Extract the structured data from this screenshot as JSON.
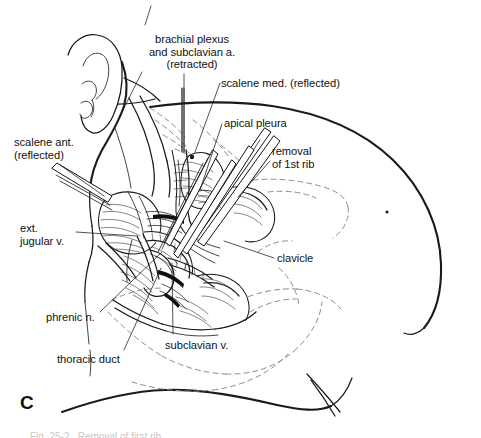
{
  "figure": {
    "letter": "C",
    "domain": "anatomical-surgical-illustration",
    "background_color": "#ffffff",
    "ink_color": "#1a1a1a",
    "hidden_structure_color": "#8d8d8d",
    "caption_partial": "Fig. 25-2.  Removal of first rib  ..."
  },
  "labels": [
    {
      "id": "brachial-plexus",
      "lines": [
        "brachial plexus",
        "and subclavian a.",
        "(retracted)"
      ],
      "text": "brachial plexus\nand subclavian a.\n(retracted)",
      "x": 134,
      "y": 33,
      "align": "center",
      "width": 116
    },
    {
      "id": "scalene-med",
      "lines": [
        "scalene med. (reflected)"
      ],
      "text": "scalene med. (reflected)",
      "x": 221,
      "y": 77,
      "align": "left",
      "width": 130
    },
    {
      "id": "apical-pleura",
      "lines": [
        "apical pleura"
      ],
      "text": "apical pleura",
      "x": 224,
      "y": 117,
      "align": "left",
      "width": 80
    },
    {
      "id": "removal-of-1st-rib",
      "lines": [
        "removal",
        "of 1st rib"
      ],
      "text": "removal\nof 1st rib",
      "x": 272,
      "y": 145,
      "align": "left",
      "width": 70
    },
    {
      "id": "scalene-ant",
      "lines": [
        "scalene ant.",
        "(reflected)"
      ],
      "text": "scalene ant.\n(reflected)",
      "x": 14,
      "y": 136,
      "align": "left",
      "width": 78
    },
    {
      "id": "ext-jugular-v",
      "lines": [
        "ext.",
        "jugular v."
      ],
      "text": "ext.\njugular v.",
      "x": 20,
      "y": 222,
      "align": "left",
      "width": 62
    },
    {
      "id": "clavicle",
      "lines": [
        "clavicle"
      ],
      "text": "clavicle",
      "x": 277,
      "y": 252,
      "align": "left",
      "width": 50
    },
    {
      "id": "phrenic-n",
      "lines": [
        "phrenic n."
      ],
      "text": "phrenic n.",
      "x": 46,
      "y": 311,
      "align": "left",
      "width": 60
    },
    {
      "id": "subclavian-v",
      "lines": [
        "subclavian v."
      ],
      "text": "subclavian v.",
      "x": 165,
      "y": 339,
      "align": "left",
      "width": 78
    },
    {
      "id": "thoracic-duct",
      "lines": [
        "thoracic duct"
      ],
      "text": "thoracic duct",
      "x": 57,
      "y": 353,
      "align": "left",
      "width": 80
    }
  ],
  "leader_lines": [
    {
      "id": "brachial-plexus-upper-tick",
      "points": "151,6 145,25"
    },
    {
      "id": "brachial-plexus-to-field",
      "points": "184,74 184,150"
    },
    {
      "id": "brachial-plexus-left-tick",
      "points": "140,72 117,120"
    },
    {
      "id": "scalene-med-leader",
      "points": "219,83 193,150"
    },
    {
      "id": "apical-pleura-leader",
      "points": "222,123 196,190"
    },
    {
      "id": "removal-rib-leader",
      "points": "270,160 236,196"
    },
    {
      "id": "scalene-ant-leader",
      "points": "58,166 106,198"
    },
    {
      "id": "ext-jugular-leader",
      "points": "74,232 137,237"
    },
    {
      "id": "clavicle-leader",
      "points": "275,258 222,240"
    },
    {
      "id": "phrenic-leader",
      "points": "98,312 160,253"
    },
    {
      "id": "subclavian-v-leader",
      "points": "173,334 172,262"
    },
    {
      "id": "thoracic-duct-leader",
      "points": "122,350 160,268"
    }
  ],
  "anatomy_elements": [
    {
      "id": "ear",
      "type": "outline"
    },
    {
      "id": "head-neck-contour",
      "type": "outline"
    },
    {
      "id": "shoulder-torso-outline",
      "type": "outline"
    },
    {
      "id": "breast-contour",
      "type": "outline"
    },
    {
      "id": "nipple-mark",
      "type": "dot"
    },
    {
      "id": "scalene-anterior-muscle",
      "type": "muscle"
    },
    {
      "id": "scalene-medius-muscle",
      "type": "muscle"
    },
    {
      "id": "brachial-plexus-trunk",
      "type": "nerve"
    },
    {
      "id": "subclavian-vessels",
      "type": "vessel"
    },
    {
      "id": "external-jugular-vein",
      "type": "vessel"
    },
    {
      "id": "clavicle-bone",
      "type": "bone"
    },
    {
      "id": "first-rib",
      "type": "bone"
    },
    {
      "id": "rib-cutter-instrument",
      "type": "instrument"
    },
    {
      "id": "retractor-blades",
      "type": "instrument"
    },
    {
      "id": "apical-pleura-dome",
      "type": "membrane"
    },
    {
      "id": "hidden-clavicle-dashed",
      "type": "hidden"
    },
    {
      "id": "hidden-ribcage-dashed",
      "type": "hidden"
    }
  ]
}
